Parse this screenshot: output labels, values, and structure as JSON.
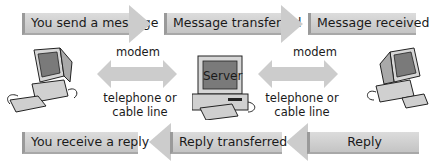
{
  "top_flow": [
    {
      "label": "You send a message"
    },
    {
      "label": "Message transferred"
    },
    {
      "label": "Message received"
    }
  ],
  "bottom_flow": [
    {
      "label": "You receive a reply"
    },
    {
      "label": "Reply transferred"
    },
    {
      "label": "Reply"
    }
  ],
  "links": [
    {
      "top": "modem",
      "bottom_line1": "telephone or",
      "bottom_line2": "cable line"
    },
    {
      "top": "modem",
      "bottom_line1": "telephone or",
      "bottom_line2": "cable line"
    }
  ],
  "server": {
    "label": "Server"
  },
  "colors": {
    "box": "#cfcfcf",
    "arrow": "#cccccc",
    "screen": "#7a7a7a"
  }
}
